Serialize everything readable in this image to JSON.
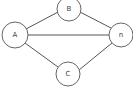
{
  "diagram": {
    "type": "graph",
    "directed": false,
    "colors": {
      "stroke": "#666666",
      "fill": "#ffffff",
      "text": "#444444"
    },
    "nodes": [
      {
        "id": "A",
        "label": "A"
      },
      {
        "id": "B",
        "label": "B"
      },
      {
        "id": "C",
        "label": "C"
      },
      {
        "id": "n",
        "label": "n"
      }
    ],
    "edges": [
      {
        "from": "A",
        "to": "B"
      },
      {
        "from": "A",
        "to": "n"
      },
      {
        "from": "A",
        "to": "C"
      },
      {
        "from": "B",
        "to": "n"
      },
      {
        "from": "C",
        "to": "n"
      }
    ]
  }
}
